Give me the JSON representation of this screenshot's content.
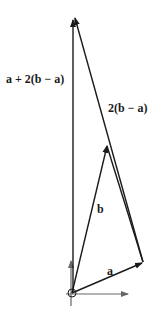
{
  "diagram": {
    "type": "vector-addition",
    "colors": {
      "vector": "#1a1a1a",
      "axis": "#666666",
      "background": "#ffffff"
    },
    "origin": [
      72,
      293
    ],
    "points": {
      "a_tip": [
        143,
        262
      ],
      "b_tip": [
        107,
        145
      ],
      "apex": [
        74,
        16
      ]
    },
    "labels": {
      "sum": "a + 2(b − a)",
      "diff": "2(b − a)",
      "b": "b",
      "a": "a"
    },
    "vectors": [
      {
        "name": "a",
        "from": "origin",
        "to": "a_tip"
      },
      {
        "name": "b",
        "from": "origin",
        "to": "b_tip"
      },
      {
        "name": "2(b − a)",
        "from": "a_tip",
        "to": "apex"
      },
      {
        "name": "a + 2(b − a)",
        "from": "origin",
        "to": "apex"
      }
    ],
    "axes": [
      "x-axis",
      "y-axis"
    ]
  }
}
